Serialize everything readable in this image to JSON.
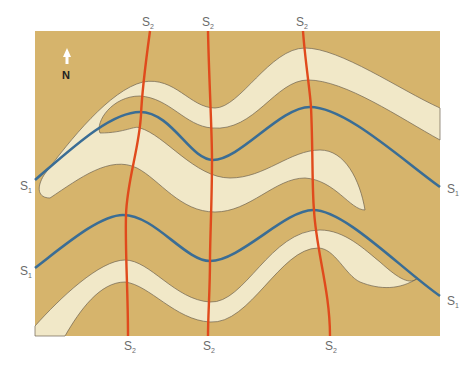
{
  "diagram": {
    "type": "geologic-map-fold-interference",
    "colors": {
      "background": "#ffffff",
      "map_fill": "#d6b46c",
      "layer_fill": "#f1e8c8",
      "layer_outline": "#6e6350",
      "s1_trace": "#3a6d95",
      "s2_trace": "#e04a1c",
      "label": "#6b6b6b"
    },
    "north_arrow": {
      "label": "N"
    },
    "s1_labels": [
      {
        "main": "S",
        "sub": "1",
        "side": "left-upper"
      },
      {
        "main": "S",
        "sub": "1",
        "side": "left-lower"
      },
      {
        "main": "S",
        "sub": "1",
        "side": "right-upper"
      },
      {
        "main": "S",
        "sub": "1",
        "side": "right-lower"
      }
    ],
    "s2_labels_top": [
      {
        "main": "S",
        "sub": "2"
      },
      {
        "main": "S",
        "sub": "2"
      },
      {
        "main": "S",
        "sub": "2"
      }
    ],
    "s2_labels_bottom": [
      {
        "main": "S",
        "sub": "2"
      },
      {
        "main": "S",
        "sub": "2"
      },
      {
        "main": "S",
        "sub": "2"
      }
    ]
  }
}
